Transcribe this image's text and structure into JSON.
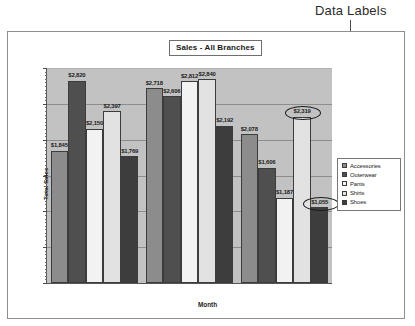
{
  "annotation": {
    "label": "Data Labels"
  },
  "chart_data": {
    "type": "bar",
    "title": "Sales - All Branches",
    "xlabel": "Month",
    "ylabel": "Total Sales",
    "categories": [
      "Jan",
      "Feb",
      "Mar"
    ],
    "ylim": [
      0,
      3000
    ],
    "ytick_labels": [
      "$0",
      "$500",
      "$1,000",
      "$1,500",
      "$2,000",
      "$2,500",
      "$3,000"
    ],
    "ytick_values": [
      0,
      500,
      1000,
      1500,
      2000,
      2500,
      3000
    ],
    "grid": true,
    "legend_position": "right",
    "series": [
      {
        "name": "Accessories",
        "color": "#8c8c8c",
        "values": [
          1845,
          2718,
          2078
        ],
        "labels": [
          "$1,845",
          "$2,718",
          "$2,078"
        ]
      },
      {
        "name": "Outerwear",
        "color": "#4f4f4f",
        "values": [
          2820,
          2606,
          1606
        ],
        "labels": [
          "$2,820",
          "$2,606",
          "$1,606"
        ]
      },
      {
        "name": "Pants",
        "color": "#f2f2f2",
        "values": [
          2150,
          2812,
          1187
        ],
        "labels": [
          "$2,150",
          "$2,812",
          "$1,187"
        ]
      },
      {
        "name": "Shirts",
        "color": "#e2e2e2",
        "values": [
          2397,
          2840,
          2319
        ],
        "labels": [
          "$2,397",
          "$2,840",
          "$2,319"
        ]
      },
      {
        "name": "Shoes",
        "color": "#3d3d3d",
        "values": [
          1769,
          2192,
          1055
        ],
        "labels": [
          "$1,769",
          "$2,192",
          "$1,055"
        ]
      }
    ],
    "highlighted_labels": [
      "$2,319",
      "$1,055"
    ],
    "plot_background": "#c2c2c2",
    "gridline_color": "#8d8d8d"
  }
}
